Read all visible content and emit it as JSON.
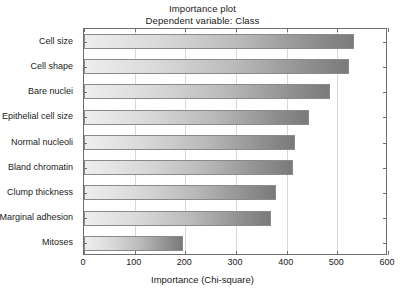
{
  "chart_data": {
    "type": "bar",
    "orientation": "horizontal",
    "title": "Importance plot",
    "subtitle": "Dependent variable: Class",
    "xlabel": "Importance (Chi-square)",
    "ylabel": "",
    "xlim": [
      0,
      600
    ],
    "xticks": [
      0,
      100,
      200,
      300,
      400,
      500,
      600
    ],
    "xtick_labels": [
      "0",
      "100",
      "200",
      "300",
      "400",
      "500",
      "600"
    ],
    "grid": true,
    "legend": "none",
    "categories": [
      "Cell size",
      "Cell shape",
      "Bare nuclei",
      "Epithelial cell size",
      "Normal nucleoli",
      "Bland chromatin",
      "Clump thickness",
      "Marginal adhesion",
      "Mitoses"
    ],
    "values": [
      532,
      524,
      485,
      445,
      417,
      412,
      378,
      370,
      196
    ],
    "bar_fill": "linear-gradient light-gray to dark-gray",
    "bar_color_start": "#eeeeee",
    "bar_color_end": "#7a7a7a",
    "bar_border_color": "#8a8a8a",
    "axis_color": "#6e6e6e",
    "grid_color": "#d8d8d8",
    "background_color": "#ffffff",
    "text_color": "#1a1a1a"
  }
}
